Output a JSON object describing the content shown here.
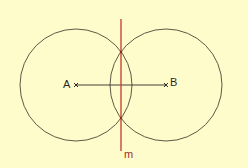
{
  "diagram": {
    "background": "#FFFCCB",
    "colors": {
      "circle": "#5C5A45",
      "segment": "#2A2A2A",
      "bisector": "#C0392B",
      "bisector_label": "#A0301F",
      "point": "#2A2A2A"
    },
    "points": [
      {
        "name": "A",
        "x": 76,
        "y": 85
      },
      {
        "name": "B",
        "x": 166,
        "y": 85
      }
    ],
    "circles": [
      {
        "center": "A",
        "cx": 76,
        "cy": 85,
        "r": 56
      },
      {
        "center": "B",
        "cx": 166,
        "cy": 85,
        "r": 56
      }
    ],
    "segment": {
      "from": "A",
      "to": "B"
    },
    "bisector": {
      "label": "m",
      "x": 121,
      "y1": 19,
      "y2": 151
    },
    "intersections": [
      {
        "x": 121,
        "y": 52
      },
      {
        "x": 121,
        "y": 118
      }
    ]
  }
}
